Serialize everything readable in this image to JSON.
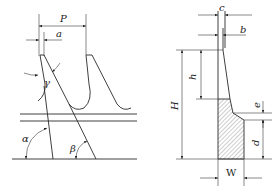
{
  "figure": {
    "left_view": {
      "title": "tooth profile side view",
      "labels": {
        "pitch": "P",
        "tip_width": "a",
        "rake_angle": "γ",
        "angle_alpha": "α",
        "angle_beta": "β"
      }
    },
    "right_view": {
      "title": "tooth cross-section",
      "labels": {
        "top_width_c": "c",
        "width_b": "b",
        "tooth_height_h": "h",
        "total_height_H": "H",
        "step_e": "e",
        "body_d": "d",
        "width_W": "W"
      }
    },
    "colors": {
      "line": "#2a2a2a",
      "background": "#ffffff"
    }
  }
}
